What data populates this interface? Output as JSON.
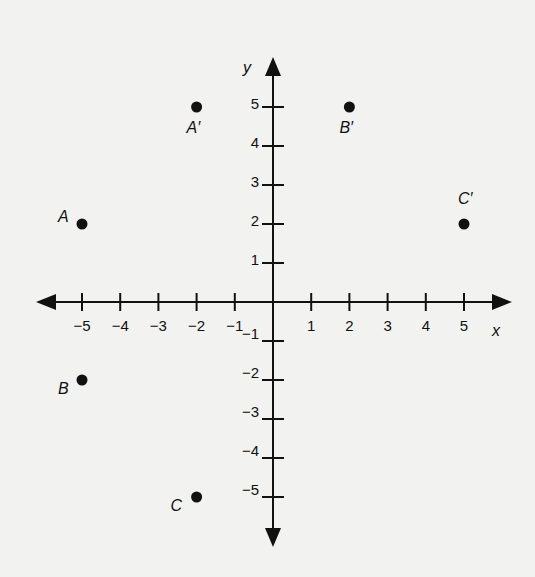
{
  "chart_data": {
    "type": "scatter",
    "title": "",
    "xlabel": "x",
    "ylabel": "y",
    "xlim": [
      -5,
      5
    ],
    "ylim": [
      -5,
      5
    ],
    "grid": false,
    "x_ticks": [
      -5,
      -4,
      -3,
      -2,
      -1,
      1,
      2,
      3,
      4,
      5
    ],
    "y_ticks": [
      5,
      4,
      3,
      2,
      1,
      -1,
      -2,
      -3,
      -4,
      -5
    ],
    "x_tick_labels": [
      "−5",
      "−4",
      "−3",
      "−2",
      "−1",
      "1",
      "2",
      "3",
      "4",
      "5"
    ],
    "y_tick_labels": [
      "5",
      "4",
      "3",
      "2",
      "1",
      "−1",
      "−2",
      "−3",
      "−4",
      "−5"
    ],
    "points": [
      {
        "label": "A",
        "x": -5,
        "y": 2
      },
      {
        "label": "B",
        "x": -5,
        "y": -2
      },
      {
        "label": "C",
        "x": -2,
        "y": -5
      },
      {
        "label": "A′",
        "x": -2,
        "y": 5
      },
      {
        "label": "B′",
        "x": 2,
        "y": 5
      },
      {
        "label": "C′",
        "x": 5,
        "y": 2
      }
    ]
  },
  "colors": {
    "background": "#f2f2f0",
    "ink": "#111111"
  }
}
